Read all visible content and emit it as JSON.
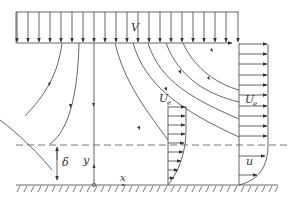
{
  "diagram": {
    "labels": {
      "free_stream": "V",
      "edge_velocity_left": "U",
      "edge_velocity_left_sub": "e",
      "edge_velocity_right": "U",
      "edge_velocity_right_sub": "e",
      "local_velocity": "u",
      "boundary_layer_thickness": "δ",
      "y_axis": "y",
      "x_axis": "x"
    },
    "colors": {
      "line": "#555555",
      "dashed": "#666666",
      "text": "#333333",
      "background": "#ffffff"
    },
    "elements": {
      "free_stream_arrow_count": 21,
      "inner_profile_arrow_count": 9,
      "outer_profile_arrow_count": 13
    }
  }
}
